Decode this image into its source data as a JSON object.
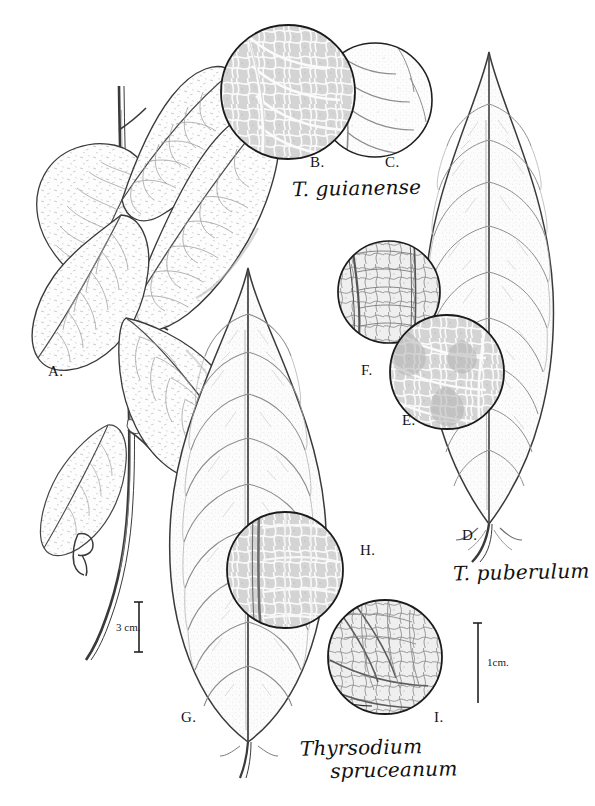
{
  "plate": {
    "kind": "botanical-illustration-plate",
    "background_color": "#ffffff",
    "ink_color": "#1a1a1a",
    "width": 595,
    "height": 806,
    "corner_note": ""
  },
  "species_names": [
    {
      "id": "guianense",
      "text": "T. guianense",
      "x": 292,
      "y": 178
    },
    {
      "id": "puberulum",
      "text": "T. puberulum",
      "x": 453,
      "y": 562
    },
    {
      "id": "spruceanum",
      "line1": "Thyrsodium",
      "line2": "spruceanum",
      "x": 300,
      "y": 736
    }
  ],
  "figure_labels": [
    {
      "id": "A",
      "text": "A.",
      "x": 48,
      "y": 364
    },
    {
      "id": "B",
      "text": "B.",
      "x": 310,
      "y": 155
    },
    {
      "id": "C",
      "text": "C.",
      "x": 385,
      "y": 155
    },
    {
      "id": "D",
      "text": "D.",
      "x": 462,
      "y": 528
    },
    {
      "id": "E",
      "text": "E.",
      "x": 402,
      "y": 413
    },
    {
      "id": "F",
      "text": "F.",
      "x": 361,
      "y": 363
    },
    {
      "id": "G",
      "text": "G.",
      "x": 181,
      "y": 710
    },
    {
      "id": "H",
      "text": "H.",
      "x": 360,
      "y": 543
    },
    {
      "id": "I",
      "text": "I.",
      "x": 434,
      "y": 710
    }
  ],
  "scale_bars": [
    {
      "id": "scale-3cm",
      "label": "3 cm.",
      "label_x": 116,
      "label_y": 621,
      "bar_x": 139,
      "bar_top": 602,
      "bar_bottom": 652
    },
    {
      "id": "scale-1cm",
      "label": "1cm.",
      "label_x": 487,
      "label_y": 662,
      "bar_x": 478,
      "bar_top": 623,
      "bar_bottom": 703
    }
  ],
  "signature": {
    "id": "artist-monogram",
    "text": "B",
    "x": 78,
    "y": 542
  },
  "detail_circles": [
    {
      "id": "B",
      "cx": 288,
      "cy": 92,
      "r": 67,
      "shading": "dark-reticulate"
    },
    {
      "id": "C",
      "cx": 375,
      "cy": 100,
      "r": 57,
      "shading": "light-stipple"
    },
    {
      "id": "F",
      "cx": 389,
      "cy": 292,
      "r": 51,
      "shading": "medium-reticulate"
    },
    {
      "id": "E",
      "cx": 447,
      "cy": 372,
      "r": 57,
      "shading": "dark-reticulate"
    },
    {
      "id": "H",
      "cx": 285,
      "cy": 570,
      "r": 58,
      "shading": "dark-reticulate"
    },
    {
      "id": "I",
      "cx": 385,
      "cy": 657,
      "r": 57,
      "shading": "medium-reticulate"
    }
  ],
  "leaves": [
    {
      "id": "branch-leaf-1",
      "note": "branch A upper-left leaf"
    },
    {
      "id": "branch-leaf-2",
      "note": "branch A upper-mid leaf"
    },
    {
      "id": "branch-leaf-3",
      "note": "branch A upper-right leaf"
    },
    {
      "id": "branch-leaf-4",
      "note": "branch A lower-left leaf"
    },
    {
      "id": "branch-leaf-5",
      "note": "branch A lower-right leaf"
    },
    {
      "id": "leaf-D",
      "note": "large elliptic leaf, T. puberulum"
    },
    {
      "id": "leaf-G",
      "note": "large obovate leaf, Thyrsodium spruceanum"
    }
  ]
}
